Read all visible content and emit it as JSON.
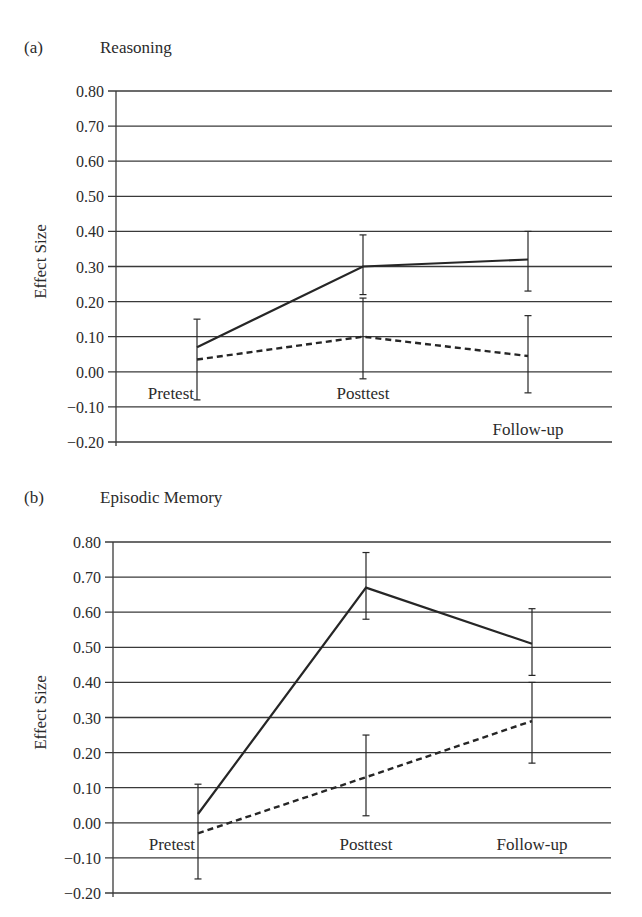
{
  "chart_data": [
    {
      "type": "line",
      "panel": "(a)",
      "title": "Reasoning",
      "xlabel": "",
      "ylabel": "Effect Size",
      "ylim": [
        -0.2,
        0.8
      ],
      "yticks": [
        "0.80",
        "0.70",
        "0.60",
        "0.50",
        "0.40",
        "0.30",
        "0.20",
        "0.10",
        "0.00",
        "-0.10",
        "-0.20"
      ],
      "categories": [
        "Pretest",
        "Posttest",
        "Follow-up"
      ],
      "grid": true,
      "legend": "none",
      "series": [
        {
          "name": "solid",
          "style": "solid",
          "values": [
            0.07,
            0.3,
            0.32
          ],
          "error_upper": [
            0.15,
            0.39,
            0.4
          ],
          "error_lower": [
            -0.08,
            0.22,
            0.23
          ]
        },
        {
          "name": "dashed",
          "style": "dashed",
          "values": [
            0.035,
            0.1,
            0.045
          ],
          "error_upper": [
            null,
            0.21,
            0.16
          ],
          "error_lower": [
            null,
            -0.02,
            -0.06
          ]
        }
      ]
    },
    {
      "type": "line",
      "panel": "(b)",
      "title": "Episodic Memory",
      "xlabel": "",
      "ylabel": "Effect Size",
      "ylim": [
        -0.2,
        0.8
      ],
      "yticks": [
        "0.80",
        "0.70",
        "0.60",
        "0.50",
        "0.40",
        "0.30",
        "0.20",
        "0.10",
        "0.00",
        "-0.10",
        "-0.20"
      ],
      "categories": [
        "Pretest",
        "Posttest",
        "Follow-up"
      ],
      "grid": true,
      "legend": "none",
      "series": [
        {
          "name": "solid",
          "style": "solid",
          "values": [
            0.025,
            0.67,
            0.51
          ],
          "error_upper": [
            0.11,
            0.77,
            0.61
          ],
          "error_lower": [
            -0.16,
            0.58,
            0.42
          ]
        },
        {
          "name": "dashed",
          "style": "dashed",
          "values": [
            -0.03,
            0.13,
            0.29
          ],
          "error_upper": [
            null,
            0.25,
            0.4
          ],
          "error_lower": [
            null,
            0.02,
            0.17
          ]
        }
      ]
    }
  ],
  "panels": {
    "a": {
      "letter": "(a)",
      "title": "Reasoning",
      "ylabel": "Effect Size"
    },
    "b": {
      "letter": "(b)",
      "title": "Episodic Memory",
      "ylabel": "Effect Size"
    }
  },
  "colors": {
    "line": "#262626",
    "grid": "#3a3a3a",
    "text": "#2b2b2b"
  }
}
